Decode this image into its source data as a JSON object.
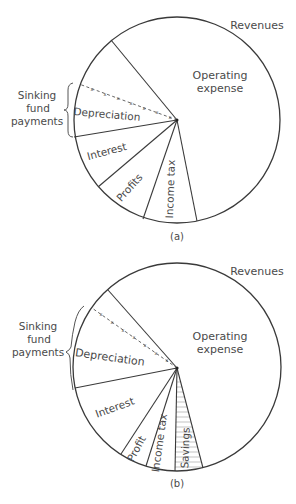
{
  "diagrams": [
    {
      "id": "a",
      "caption": "(a)",
      "revenues_label": "Revenues",
      "bracket_label": [
        "Sinking",
        "fund",
        "payments"
      ],
      "segments": [
        {
          "label": "Operating expense",
          "lines": [
            "Operating",
            "expense"
          ]
        },
        {
          "label": "Depreciation"
        },
        {
          "label": "Interest"
        },
        {
          "label": "Profits"
        },
        {
          "label": "Income tax"
        }
      ]
    },
    {
      "id": "b",
      "caption": "(b)",
      "revenues_label": "Revenues",
      "bracket_label": [
        "Sinking",
        "fund",
        "payments"
      ],
      "segments": [
        {
          "label": "Operating expense",
          "lines": [
            "Operating",
            "expense"
          ]
        },
        {
          "label": "Depreciation"
        },
        {
          "label": "Interest"
        },
        {
          "label": "Profit"
        },
        {
          "label": "Income tax"
        },
        {
          "label": "Savings",
          "pattern": "horizontal-hatch"
        }
      ]
    }
  ],
  "colors": {
    "line": "#3a3a3a",
    "text": "#4a4a4a",
    "hatch": "#9a9a9a",
    "background": "#ffffff"
  }
}
